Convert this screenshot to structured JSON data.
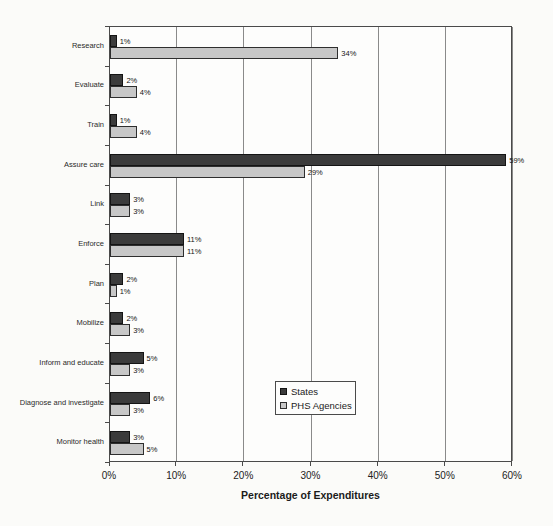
{
  "chart_data": {
    "type": "bar",
    "orientation": "horizontal",
    "title": "",
    "xlabel": "Percentage of Expenditures",
    "ylabel": "",
    "xlim": [
      0,
      60
    ],
    "x_ticks": [
      "0%",
      "10%",
      "20%",
      "30%",
      "40%",
      "50%",
      "60%"
    ],
    "grid": true,
    "legend_position": "inside-right",
    "value_label_suffix": "%",
    "categories": [
      "Research",
      "Evaluate",
      "Train",
      "Assure care",
      "Link",
      "Enforce",
      "Plan",
      "Mobilize",
      "Inform and educate",
      "Diagnose and investigate",
      "Monitor health"
    ],
    "series": [
      {
        "name": "States",
        "color": "#3b3b3b",
        "border_color": "#141414",
        "values": [
          1,
          2,
          1,
          59,
          3,
          11,
          2,
          2,
          5,
          6,
          3
        ]
      },
      {
        "name": "PHS Agencies",
        "color": "#c7c7c7",
        "border_color": "#2e2e2e",
        "values": [
          34,
          4,
          4,
          29,
          3,
          11,
          1,
          3,
          3,
          3,
          5
        ]
      }
    ]
  },
  "colors": {
    "background": "#fbfbf9",
    "plot_background": "#fdfdfc",
    "gridline": "#8a8a8a",
    "axis": "#4a4a4a",
    "text": "#1b1b1b"
  }
}
